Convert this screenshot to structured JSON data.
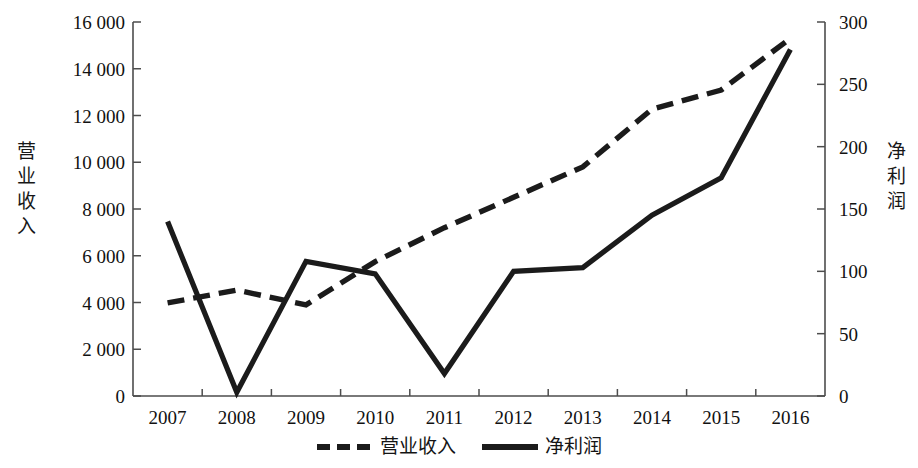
{
  "chart_data": {
    "type": "line",
    "title": "",
    "xlabel": "",
    "categories": [
      "2007",
      "2008",
      "2009",
      "2010",
      "2011",
      "2012",
      "2013",
      "2014",
      "2015",
      "2016"
    ],
    "grid": false,
    "legend_position": "bottom",
    "series": [
      {
        "name": "营业收入",
        "axis": "left",
        "style": "dashed",
        "color": "#1b1b1b",
        "values": [
          3980,
          4530,
          3900,
          5750,
          7200,
          8500,
          9800,
          12270,
          13090,
          15300
        ]
      },
      {
        "name": "净利润",
        "axis": "right",
        "style": "solid",
        "color": "#1b1b1b",
        "values": [
          140,
          3,
          108,
          98,
          18,
          100,
          103,
          145,
          175,
          278
        ]
      }
    ],
    "left_axis": {
      "label": "营业收入",
      "ylim": [
        0,
        16000
      ],
      "ticks": [
        0,
        2000,
        4000,
        6000,
        8000,
        10000,
        12000,
        14000,
        16000
      ],
      "tick_labels": [
        "0",
        "2 000",
        "4 000",
        "6 000",
        "8 000",
        "10 000",
        "12 000",
        "14 000",
        "16 000"
      ]
    },
    "right_axis": {
      "label": "净利润",
      "ylim": [
        0,
        300
      ],
      "ticks": [
        0,
        50,
        100,
        150,
        200,
        250,
        300
      ],
      "tick_labels": [
        "0",
        "50",
        "100",
        "150",
        "200",
        "250",
        "300"
      ]
    }
  },
  "legend": {
    "entries": [
      {
        "label": "营业收入",
        "style": "dashed"
      },
      {
        "label": "净利润",
        "style": "solid"
      }
    ]
  },
  "axis_titles": {
    "left": "营业收入",
    "right": "净利润"
  }
}
